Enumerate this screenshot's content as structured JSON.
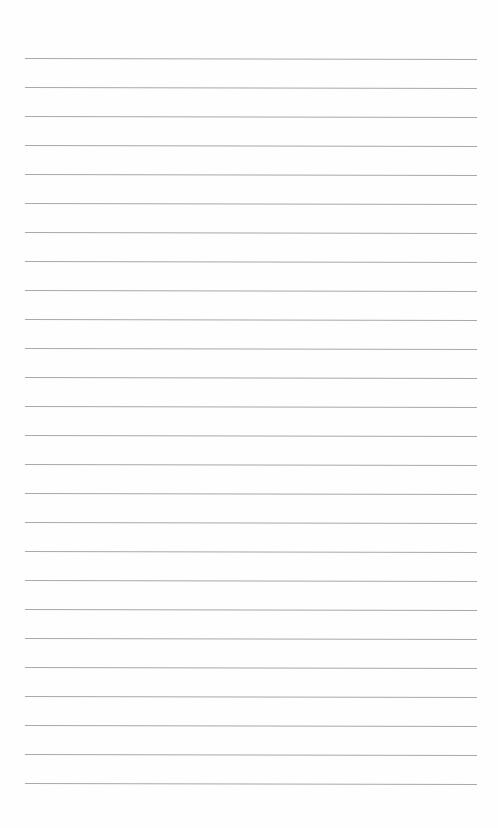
{
  "page": {
    "type": "ruled-paper",
    "background_color": "#fefefe",
    "line_color": "#9a9a9a",
    "line_count": 26,
    "first_line_y": 58,
    "line_spacing": 29,
    "line_left_x": 25,
    "line_width": 452,
    "text_lines": [
      "",
      "",
      "",
      "",
      "",
      "",
      "",
      "",
      "",
      "",
      "",
      "",
      "",
      "",
      "",
      "",
      "",
      "",
      "",
      "",
      "",
      "",
      "",
      "",
      "",
      ""
    ]
  }
}
